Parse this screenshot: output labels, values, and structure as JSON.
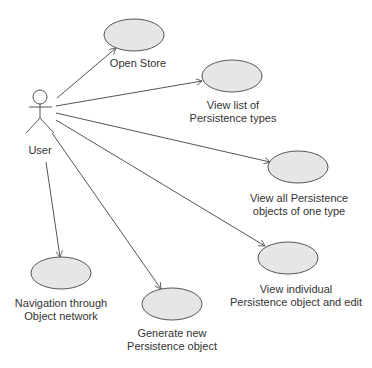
{
  "diagram": {
    "type": "uml-use-case",
    "actor": {
      "label": "User"
    },
    "use_cases": [
      {
        "id": "open_store",
        "label_lines": [
          "Open Store"
        ]
      },
      {
        "id": "view_types",
        "label_lines": [
          "View list of",
          "Persistence types"
        ]
      },
      {
        "id": "view_all",
        "label_lines": [
          "View all Persistence",
          "objects of one type"
        ]
      },
      {
        "id": "view_individual",
        "label_lines": [
          "View individual",
          "Persistence object and edit"
        ]
      },
      {
        "id": "navigation",
        "label_lines": [
          "Navigation through",
          "Object network"
        ]
      },
      {
        "id": "generate",
        "label_lines": [
          "Generate new",
          "Persistence object"
        ]
      }
    ],
    "colors": {
      "ellipse_fill": "#e6e6e6",
      "stroke": "#555555",
      "text": "#333333"
    }
  }
}
